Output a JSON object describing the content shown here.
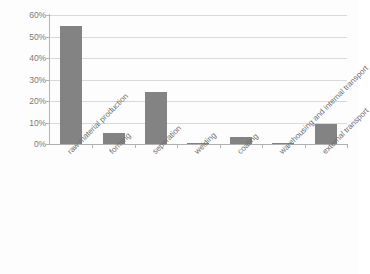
{
  "chart_data": {
    "type": "bar",
    "title": "",
    "subtitle": "",
    "xlabel": "",
    "ylabel": "",
    "categories": [
      "raw material production",
      "forming",
      "seperation",
      "welding",
      "coating",
      "warehousing and internal transport",
      "external transport"
    ],
    "values": [
      55,
      5,
      24,
      0.6,
      3.4,
      0.6,
      9.2
    ],
    "value_format": "percent",
    "ylim": [
      0,
      60
    ],
    "ytick_values": [
      0,
      10,
      20,
      30,
      40,
      50,
      60
    ],
    "ytick_labels": [
      "0%",
      "10%",
      "20%",
      "30%",
      "40%",
      "50%",
      "60%"
    ],
    "grid": true,
    "grid_axis": "y",
    "legend": false,
    "legend_position": "none",
    "series": [
      {
        "name": "share",
        "values": [
          55,
          5,
          24,
          0.6,
          3.4,
          0.6,
          9.2
        ]
      }
    ],
    "annotations": []
  },
  "style": {
    "bar_color": "#838383",
    "grid_color": "#d9d9d9",
    "axis_color": "#b3b3b3",
    "tick_label_color": "#7a7a7a",
    "category_label_color": "#6f6f6f",
    "background_color": "#fdfdfd"
  }
}
